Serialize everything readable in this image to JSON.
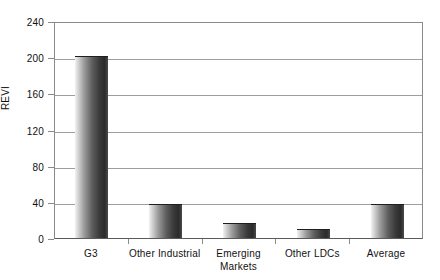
{
  "chart_data": {
    "type": "bar",
    "title": "",
    "subtitle": "",
    "xlabel": "",
    "ylabel": "REVI",
    "categories": [
      "G3",
      "Other Industrial",
      "Emerging Markets",
      "Other LDCs",
      "Average"
    ],
    "category_lines": [
      [
        "G3"
      ],
      [
        "Other Industrial"
      ],
      [
        "Emerging",
        "Markets"
      ],
      [
        "Other LDCs"
      ],
      [
        "Average"
      ]
    ],
    "values": [
      201,
      38,
      17,
      10,
      38
    ],
    "ylim": [
      0,
      240
    ],
    "yticks": [
      0,
      40,
      80,
      120,
      160,
      200,
      240
    ],
    "ytick_labels": [
      "0",
      "40",
      "80",
      "120",
      "160",
      "200",
      "240"
    ],
    "grid": "horizontal",
    "legend": "none",
    "series": [
      {
        "name": "REVI",
        "values": [
          201,
          38,
          17,
          10,
          38
        ]
      }
    ],
    "bar_fill": "#3a3a3a",
    "bar_style": "vertical-gradient-cylinder",
    "axis_color": "#8a8a8a",
    "grid_color": "#9d9d9d",
    "background": "#ffffff"
  }
}
